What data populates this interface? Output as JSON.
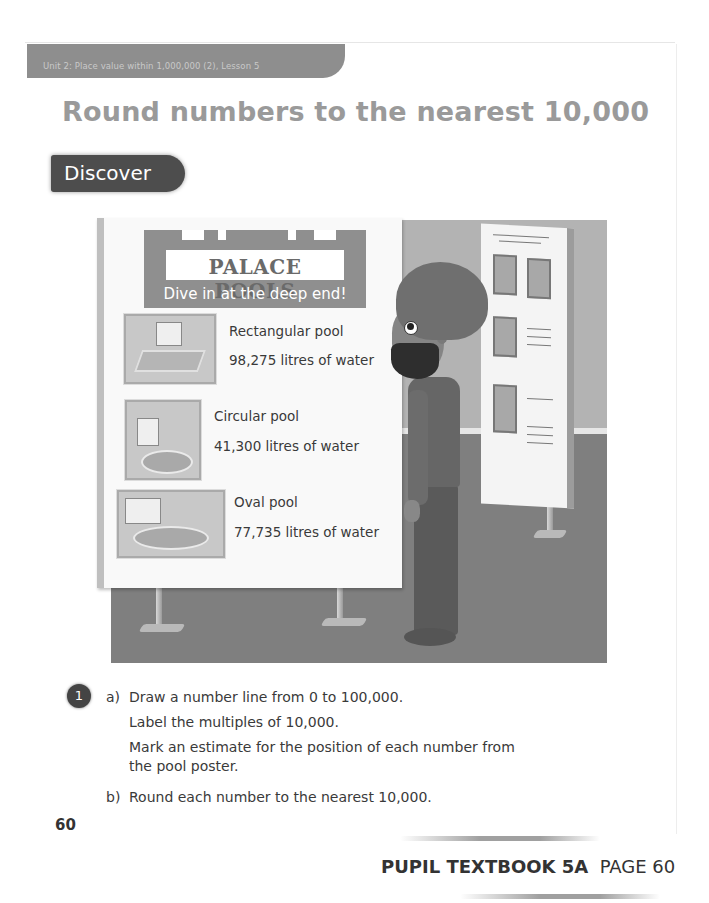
{
  "header": {
    "unit_label": "Unit 2: Place value within 1,000,000 (2), Lesson 5",
    "title": "Round numbers to the nearest 10,000",
    "section": "Discover"
  },
  "illustration": {
    "poster": {
      "name": "PALACE POOLS",
      "tagline": "Dive in at the deep end!",
      "pools": [
        {
          "name": "Rectangular pool",
          "volume": "98,275 litres of water"
        },
        {
          "name": "Circular pool",
          "volume": "41,300 litres of water"
        },
        {
          "name": "Oval pool",
          "volume": "77,735 litres of water"
        }
      ]
    }
  },
  "question": {
    "number": "1",
    "parts": [
      {
        "label": "a)",
        "lines": [
          "Draw a number line from 0 to 100,000.",
          "Label the multiples of 10,000.",
          "Mark an estimate for the position of each number from",
          "the pool poster."
        ]
      },
      {
        "label": "b)",
        "lines": [
          "Round each number to the nearest 10,000."
        ]
      }
    ]
  },
  "footer": {
    "page_number": "60",
    "book_label": "PUPIL TEXTBOOK 5A",
    "page_label": "PAGE 60"
  }
}
